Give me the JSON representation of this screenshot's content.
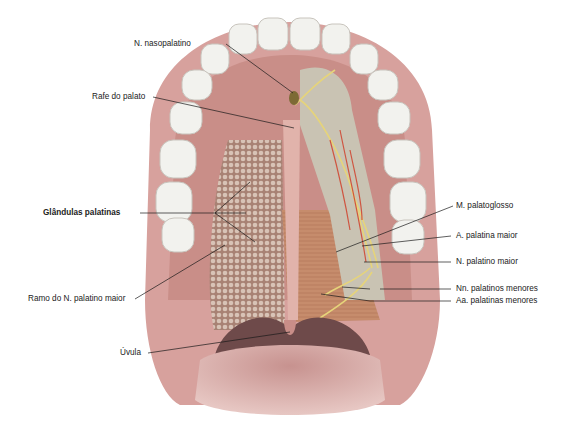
{
  "figure": {
    "colors": {
      "gingiva": "#d9a3a0",
      "mucosa": "#c98c86",
      "muscle": "#c48a6a",
      "tooth": "#f2f2ee",
      "nerve": "#e8d27a",
      "artery": "#d0553f",
      "leader_line": "#1a1a1a"
    }
  },
  "labels": {
    "n_nasopalatino": "N. nasopalatino",
    "rafe_palato": "Rafe do palato",
    "glandulas_palatinas": "Glândulas palatinas",
    "ramo_n_palatino_maior": "Ramo do N. palatino maior",
    "uvula": "Úvula",
    "m_palatoglosso": "M. palatoglosso",
    "a_palatina_maior": "A. palatina maior",
    "n_palatino_maior": "N. palatino maior",
    "nn_palatinos_menores": "Nn. palatinos menores",
    "aa_palatinas_menores": "Aa. palatinas menores"
  }
}
